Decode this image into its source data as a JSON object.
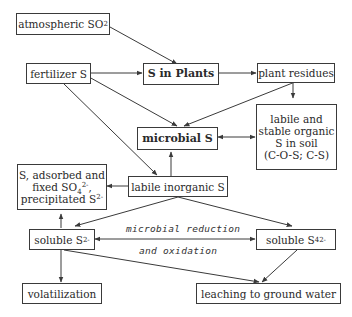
{
  "diagram": {
    "nodes": {
      "atmospheric_so2": {
        "text": "atmospheric SO",
        "sub": "2"
      },
      "fertilizer_s": {
        "text": "fertilizer S"
      },
      "s_in_plants": {
        "text": "S in Plants"
      },
      "plant_residues": {
        "text": "plant residues"
      },
      "organic_s_soil": {
        "lines": [
          "labile and",
          "stable organic",
          "S in soil",
          "(C-O-S; C-S)"
        ]
      },
      "microbial_s": {
        "text": "microbial S"
      },
      "labile_inorganic_s": {
        "text": "labile inorganic S"
      },
      "adsorbed_fixed": {
        "line1": "S, adsorbed and",
        "line2_pre": "fixed SO",
        "line2_sub": "4",
        "line2_sup": "2-",
        "line2_post": ",",
        "line3_pre": "precipitated S",
        "line3_sup": "2-"
      },
      "soluble_s2": {
        "text": "soluble S",
        "sup": "2-"
      },
      "soluble_s4": {
        "text": "soluble S",
        "sub": "4",
        "sup": "2-"
      },
      "volatilization": {
        "text": "volatilization"
      },
      "leaching": {
        "text": "leaching to ground water"
      }
    },
    "edge_labels": {
      "line1": "microbial reduction",
      "line2": "and oxidation"
    },
    "colors": {
      "line": "#3a3a3a",
      "background": "#ffffff"
    }
  }
}
